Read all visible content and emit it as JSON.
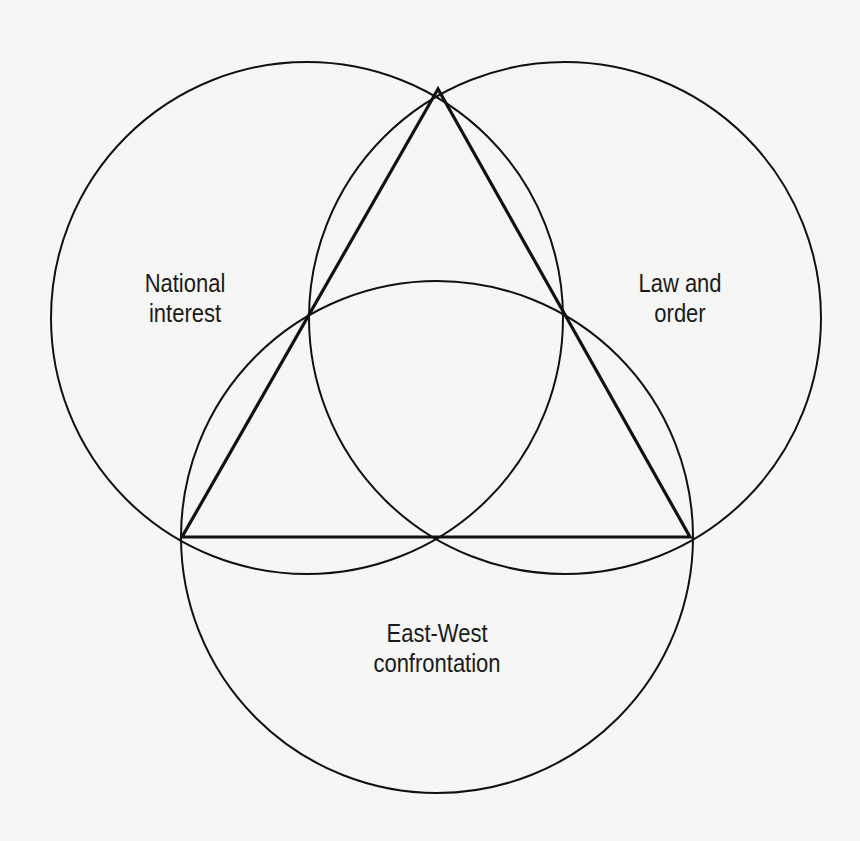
{
  "diagram": {
    "type": "three-circle venn with inscribed triangle",
    "circles": [
      {
        "id": "national-interest",
        "label_lines": [
          "National",
          "interest"
        ],
        "cx": 307,
        "cy": 318,
        "r": 256
      },
      {
        "id": "law-and-order",
        "label_lines": [
          "Law and",
          "order"
        ],
        "cx": 565,
        "cy": 318,
        "r": 256
      },
      {
        "id": "east-west-confrontation",
        "label_lines": [
          "East-West",
          "confrontation"
        ],
        "cx": 437,
        "cy": 537,
        "r": 256
      }
    ],
    "triangle": {
      "outer_vertices": [
        [
          438,
          89
        ],
        [
          182,
          537
        ],
        [
          690,
          537
        ]
      ],
      "midpoints": [
        [
          308,
          308
        ],
        [
          566,
          312
        ],
        [
          437,
          537
        ]
      ]
    },
    "stroke_color": "#111111",
    "background_color": "#f6f6f4"
  },
  "labels": {
    "national_interest": {
      "line1": "National",
      "line2": "interest"
    },
    "law_and_order": {
      "line1": "Law and",
      "line2": "order"
    },
    "east_west": {
      "line1": "East-West",
      "line2": "confrontation"
    }
  }
}
